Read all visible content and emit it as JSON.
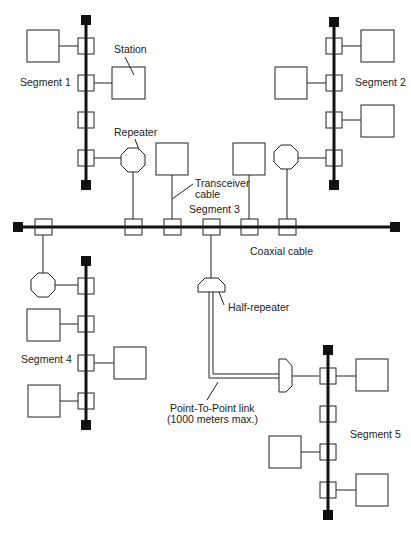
{
  "diagram": {
    "labels": {
      "station": "Station",
      "segment1": "Segment 1",
      "segment2": "Segment 2",
      "segment3": "Segment 3",
      "segment4": "Segment 4",
      "segment5": "Segment 5",
      "repeater": "Repeater",
      "transceiver_line1": "Transceiver",
      "transceiver_line2": "cable",
      "coaxial": "Coaxial cable",
      "half_repeater": "Half-repeater",
      "ptp_line1": "Point-To-Point link",
      "ptp_line2": "(1000 meters max.)"
    },
    "colors": {
      "line": "#111111",
      "background": "#ffffff"
    }
  }
}
